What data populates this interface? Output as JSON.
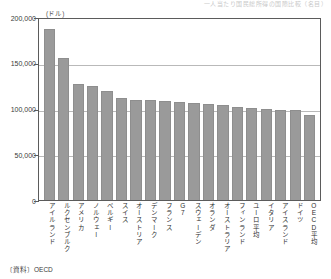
{
  "header_crop_text": "一人当たり国民総所得の国際比較（名目）",
  "source_note": "〔資料〕OECD",
  "chart_data": {
    "type": "bar",
    "title": "",
    "subtitle": "",
    "xlabel": "",
    "ylabel": "",
    "unit_label": "(ドル)",
    "ylim": [
      0,
      200000
    ],
    "yticks": [
      200000,
      150000,
      100000,
      50000,
      0
    ],
    "ytick_labels": [
      "200,000",
      "150,000",
      "100,000",
      "50,000",
      "0"
    ],
    "grid": true,
    "legend": "none",
    "bar_color": "#9a9a9a",
    "categories": [
      "アイルランド",
      "ルクセンブルク",
      "アメリカ",
      "ノルウェー",
      "ベルギー",
      "スイス",
      "オーストリア",
      "デンマーク",
      "フランス",
      "G7",
      "スウェーデン",
      "オランダ",
      "オーストラリア",
      "フィンランド",
      "ユーロ平均",
      "イタリア",
      "アイスランド",
      "ドイツ",
      "OECD平均"
    ],
    "values": [
      189000,
      157000,
      128000,
      126000,
      121000,
      113000,
      110000,
      110000,
      109000,
      108000,
      107000,
      106000,
      105000,
      103000,
      102000,
      101000,
      100000,
      99000,
      94000
    ]
  }
}
